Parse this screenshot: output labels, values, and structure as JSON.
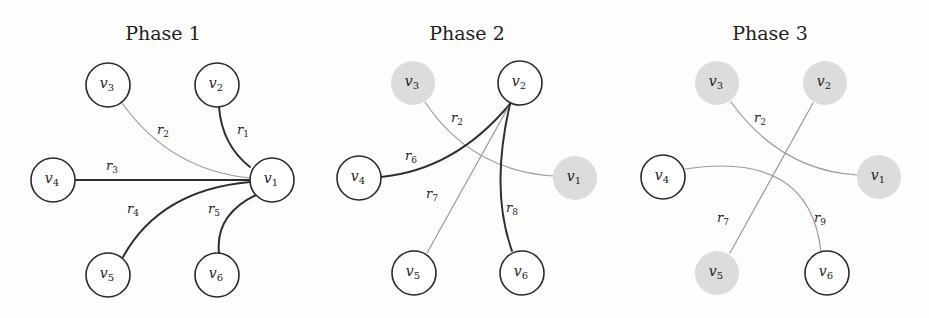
{
  "colors": {
    "background": "#fdfdfc",
    "strong_edge": "#2e2e2e",
    "weak_edge": "#9a9a9a",
    "node_stroke": "#2a2a2a",
    "node_fill": "#ffffff",
    "inactive_node_fill": "#dcdcdc"
  },
  "node_radius": 22,
  "panels": [
    {
      "title": "Phase 1",
      "title_pos": [
        163,
        40
      ],
      "nodes": [
        {
          "id": "v1",
          "name": "v",
          "sub": "1",
          "x": 272,
          "y": 180,
          "active": true
        },
        {
          "id": "v2",
          "name": "v",
          "sub": "2",
          "x": 217,
          "y": 85,
          "active": true
        },
        {
          "id": "v3",
          "name": "v",
          "sub": "3",
          "x": 108,
          "y": 85,
          "active": true
        },
        {
          "id": "v4",
          "name": "v",
          "sub": "4",
          "x": 53,
          "y": 180,
          "active": true
        },
        {
          "id": "v5",
          "name": "v",
          "sub": "5",
          "x": 108,
          "y": 275,
          "active": true
        },
        {
          "id": "v6",
          "name": "v",
          "sub": "6",
          "x": 217,
          "y": 275,
          "active": true
        }
      ],
      "edges": [
        {
          "label": "r",
          "sub": "1",
          "path": "M219,107 Q222,145 250,167",
          "strong": true,
          "lx": 243,
          "ly": 134
        },
        {
          "label": "r",
          "sub": "2",
          "path": "M122,103 Q170,170 250,178",
          "strong": false,
          "lx": 163,
          "ly": 134
        },
        {
          "label": "r",
          "sub": "3",
          "path": "M75,180 L250,180",
          "strong": true,
          "lx": 112,
          "ly": 170
        },
        {
          "label": "r",
          "sub": "4",
          "path": "M123,257 Q160,190 250,182",
          "strong": true,
          "lx": 133,
          "ly": 213
        },
        {
          "label": "r",
          "sub": "5",
          "path": "M219,253 Q215,215 256,195",
          "strong": true,
          "lx": 214,
          "ly": 213
        }
      ]
    },
    {
      "title": "Phase 2",
      "title_pos": [
        467,
        40
      ],
      "nodes": [
        {
          "id": "v1",
          "name": "v",
          "sub": "1",
          "x": 575,
          "y": 178,
          "active": false
        },
        {
          "id": "v2",
          "name": "v",
          "sub": "2",
          "x": 520,
          "y": 83,
          "active": true
        },
        {
          "id": "v3",
          "name": "v",
          "sub": "3",
          "x": 413,
          "y": 83,
          "active": false
        },
        {
          "id": "v4",
          "name": "v",
          "sub": "4",
          "x": 359,
          "y": 178,
          "active": true
        },
        {
          "id": "v5",
          "name": "v",
          "sub": "5",
          "x": 414,
          "y": 273,
          "active": true
        },
        {
          "id": "v6",
          "name": "v",
          "sub": "6",
          "x": 522,
          "y": 273,
          "active": true
        }
      ],
      "edges": [
        {
          "label": "r",
          "sub": "2",
          "path": "M425,102 Q470,170 553,176",
          "strong": false,
          "lx": 457,
          "ly": 122
        },
        {
          "label": "r",
          "sub": "6",
          "path": "M381,177 Q455,170 510,104",
          "strong": true,
          "lx": 411,
          "ly": 160
        },
        {
          "label": "r",
          "sub": "7",
          "path": "M427,253 L510,104",
          "strong": false,
          "lx": 432,
          "ly": 198
        },
        {
          "label": "r",
          "sub": "8",
          "path": "M512,251 Q490,190 510,104",
          "strong": true,
          "lx": 512,
          "ly": 212
        }
      ]
    },
    {
      "title": "Phase 3",
      "title_pos": [
        770,
        40
      ],
      "nodes": [
        {
          "id": "v1",
          "name": "v",
          "sub": "1",
          "x": 879,
          "y": 177,
          "active": false
        },
        {
          "id": "v2",
          "name": "v",
          "sub": "2",
          "x": 825,
          "y": 83,
          "active": false
        },
        {
          "id": "v3",
          "name": "v",
          "sub": "3",
          "x": 717,
          "y": 83,
          "active": false
        },
        {
          "id": "v4",
          "name": "v",
          "sub": "4",
          "x": 663,
          "y": 177,
          "active": true
        },
        {
          "id": "v5",
          "name": "v",
          "sub": "5",
          "x": 717,
          "y": 273,
          "active": false
        },
        {
          "id": "v6",
          "name": "v",
          "sub": "6",
          "x": 827,
          "y": 273,
          "active": true
        }
      ],
      "edges": [
        {
          "label": "r",
          "sub": "2",
          "path": "M731,102 Q780,170 857,175",
          "strong": false,
          "lx": 760,
          "ly": 122
        },
        {
          "label": "r",
          "sub": "7",
          "path": "M730,253 L813,103",
          "strong": false,
          "lx": 723,
          "ly": 222
        },
        {
          "label": "r",
          "sub": "9",
          "path": "M685,169 Q810,150 821,252",
          "strong": false,
          "lx": 820,
          "ly": 222
        }
      ]
    }
  ]
}
